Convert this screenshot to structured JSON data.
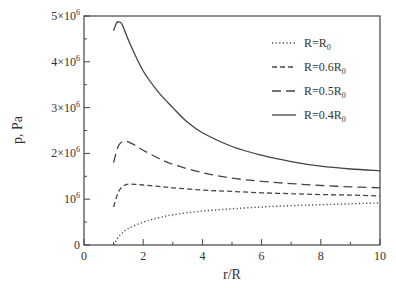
{
  "chart_data": {
    "type": "line",
    "title": "",
    "xlabel": "r/R",
    "ylabel": "p, Pa",
    "xlim": [
      0,
      10
    ],
    "ylim": [
      0,
      5000000
    ],
    "grid": false,
    "legend_position": "upper right (inside)",
    "x_ticks": [
      "0",
      "2",
      "4",
      "6",
      "8",
      "10"
    ],
    "y_ticks": [
      {
        "value": 0,
        "label": "0",
        "sup": ""
      },
      {
        "value": 1000000,
        "label": "10",
        "sup": "6"
      },
      {
        "value": 2000000,
        "label": "2×10",
        "sup": "6"
      },
      {
        "value": 3000000,
        "label": "3×10",
        "sup": "6"
      },
      {
        "value": 4000000,
        "label": "4×10",
        "sup": "6"
      },
      {
        "value": 5000000,
        "label": "5×10",
        "sup": "6"
      }
    ],
    "series": [
      {
        "name": "R=R0",
        "label_main": "R=R",
        "label_sub": "0",
        "style": "dotted",
        "x": [
          1.0,
          1.2,
          1.5,
          2.0,
          2.5,
          3.0,
          4.0,
          5.0,
          6.0,
          7.0,
          8.0,
          9.0,
          10.0
        ],
        "y": [
          0,
          200000,
          360000,
          500000,
          590000,
          660000,
          740000,
          790000,
          830000,
          860000,
          880000,
          900000,
          920000
        ]
      },
      {
        "name": "R=0.6R0",
        "label_main": "R=0.6R",
        "label_sub": "0",
        "style": "short-dash",
        "x": [
          1.0,
          1.1,
          1.2,
          1.35,
          1.55,
          1.8,
          2.0,
          2.5,
          3.0,
          4.0,
          5.0,
          6.0,
          7.0,
          8.0,
          9.0,
          10.0
        ],
        "y": [
          830000,
          1050000,
          1200000,
          1300000,
          1330000,
          1320000,
          1310000,
          1280000,
          1250000,
          1200000,
          1170000,
          1140000,
          1120000,
          1100000,
          1090000,
          1070000
        ]
      },
      {
        "name": "R=0.5R0",
        "label_main": "R=0.5R",
        "label_sub": "0",
        "style": "long-dash",
        "x": [
          1.0,
          1.1,
          1.2,
          1.35,
          1.5,
          1.8,
          2.0,
          2.5,
          3.0,
          4.0,
          5.0,
          6.0,
          7.0,
          8.0,
          9.0,
          10.0
        ],
        "y": [
          1800000,
          2050000,
          2200000,
          2270000,
          2250000,
          2150000,
          2070000,
          1900000,
          1760000,
          1580000,
          1460000,
          1390000,
          1340000,
          1300000,
          1270000,
          1250000
        ]
      },
      {
        "name": "R=0.4R0",
        "label_main": "R=0.4R",
        "label_sub": "0",
        "style": "solid",
        "x": [
          1.0,
          1.1,
          1.2,
          1.3,
          1.55,
          2.0,
          2.5,
          3.0,
          3.5,
          4.0,
          5.0,
          6.0,
          7.0,
          8.0,
          9.0,
          10.0
        ],
        "y": [
          4680000,
          4850000,
          4870000,
          4800000,
          4400000,
          3800000,
          3350000,
          3000000,
          2680000,
          2450000,
          2150000,
          1960000,
          1820000,
          1720000,
          1660000,
          1620000
        ]
      }
    ]
  }
}
